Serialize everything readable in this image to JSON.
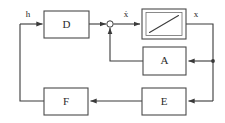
{
  "diagram": {
    "type": "block-diagram",
    "canvas": {
      "width": 225,
      "height": 123
    },
    "colors": {
      "background": "#ffffff",
      "block_border": "#4a4a4a",
      "block_fill": "#ffffff",
      "wire": "#3a3a3a",
      "text": "#2b2b2b"
    },
    "blocks": [
      {
        "id": "D",
        "label": "D",
        "shape": "rect",
        "x": 44,
        "y": 11,
        "w": 45,
        "h": 27
      },
      {
        "id": "INT",
        "label": "",
        "shape": "rect-ramp",
        "x": 142,
        "y": 9,
        "w": 44,
        "h": 30,
        "symbol": "ramp-integrator"
      },
      {
        "id": "A",
        "label": "A",
        "shape": "rect",
        "x": 143,
        "y": 47,
        "w": 43,
        "h": 28
      },
      {
        "id": "E",
        "label": "E",
        "shape": "rect",
        "x": 142,
        "y": 88,
        "w": 44,
        "h": 27
      },
      {
        "id": "F",
        "label": "F",
        "shape": "rect",
        "x": 44,
        "y": 88,
        "w": 44,
        "h": 27
      }
    ],
    "junctions": [
      {
        "id": "sum",
        "type": "summing-circle",
        "cx": 110,
        "cy": 24,
        "r": 3.2
      },
      {
        "id": "branch",
        "type": "node-dot",
        "cx": 213,
        "cy": 61,
        "r": 1.9
      }
    ],
    "signals": [
      {
        "id": "h",
        "label": "h",
        "x": 28,
        "y": 17
      },
      {
        "id": "xdot",
        "label": "ẋ",
        "x": 126,
        "y": 17
      },
      {
        "id": "x",
        "label": "x",
        "x": 196,
        "y": 17
      }
    ],
    "connections": [
      {
        "from": "input",
        "to": "D",
        "label": "h"
      },
      {
        "from": "D",
        "to": "sum",
        "label": ""
      },
      {
        "from": "sum",
        "to": "INT",
        "label": "ẋ"
      },
      {
        "from": "INT",
        "to": "branch",
        "label": "x"
      },
      {
        "from": "branch",
        "to": "A",
        "label": ""
      },
      {
        "from": "A",
        "to": "sum",
        "label": ""
      },
      {
        "from": "branch",
        "to": "E",
        "label": ""
      },
      {
        "from": "E",
        "to": "F",
        "label": ""
      },
      {
        "from": "F",
        "to": "input",
        "label": ""
      }
    ]
  }
}
